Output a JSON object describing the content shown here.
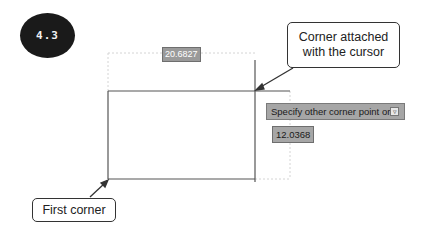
{
  "figure": {
    "badge_label": "4.3"
  },
  "drawing": {
    "width_dimension": "20.6827",
    "height_input_value": "12.0368",
    "command_prompt": "Specify other corner point or",
    "prompt_icon": "down-arrow-icon"
  },
  "callouts": {
    "cursor_corner_line1": "Corner attached",
    "cursor_corner_line2": "with the cursor",
    "first_corner": "First corner"
  },
  "colors": {
    "badge_bg": "#1a1a1a",
    "rectangle_stroke": "#555555",
    "dimension_line": "#d8d8d8",
    "tooltip_bg": "#a6a6a6",
    "callout_border": "#333333"
  }
}
